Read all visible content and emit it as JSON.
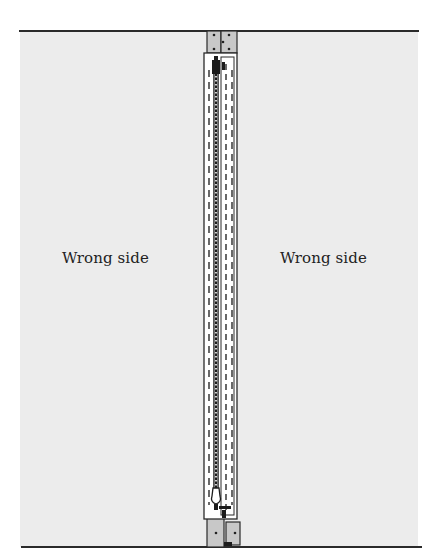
{
  "diagram": {
    "type": "sewing-illustration",
    "labels": {
      "left_panel": "Wrong side",
      "right_panel": "Wrong side"
    },
    "colors": {
      "fabric": "#ececec",
      "seam_allowance": "#c8c8c8",
      "zipper_tape": "#ffffff",
      "outline": "#2a2a2a",
      "background": "#ffffff"
    }
  }
}
